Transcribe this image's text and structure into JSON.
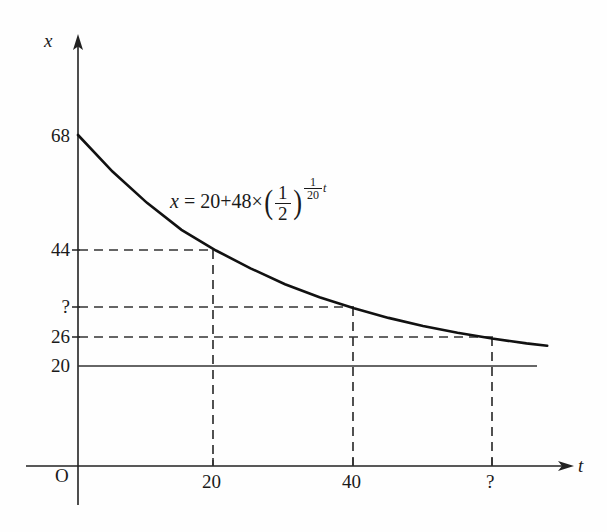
{
  "chart_data": {
    "type": "line",
    "title": "",
    "xlabel": "t",
    "ylabel": "x",
    "equation_text": "x = 20+48×(1/2)^((1/20)t)",
    "equation_parts": {
      "lhs": "x",
      "equals": "=",
      "constant": "20",
      "plus": "+",
      "coefficient": "48",
      "times": "×",
      "base_numerator": "1",
      "base_denominator": "2",
      "exponent_numerator": "1",
      "exponent_denominator": "20",
      "exponent_variable": "t"
    },
    "origin_label": "O",
    "x_ticks": [
      "20",
      "40",
      "?"
    ],
    "x_tick_values": [
      20,
      40,
      null
    ],
    "y_ticks": [
      "68",
      "44",
      "?",
      "26",
      "20"
    ],
    "y_tick_values": [
      68,
      44,
      null,
      26,
      20
    ],
    "asymptote_value": 20,
    "asymptote_label": "20",
    "xlim": [
      0,
      75
    ],
    "ylim": [
      0,
      75
    ],
    "grid": false,
    "legend": "none",
    "series": [
      {
        "name": "x = 20 + 48(1/2)^(t/20)",
        "x": [
          0,
          5,
          10,
          15,
          20,
          25,
          30,
          35,
          40,
          45,
          50,
          55,
          60,
          65,
          68
        ],
        "y": [
          68,
          60.4,
          53.9,
          48.3,
          44,
          40.3,
          37.0,
          34.3,
          32.0,
          30.0,
          28.3,
          26.9,
          25.7,
          24.7,
          24.2
        ]
      }
    ],
    "marked_points": [
      {
        "x": 20,
        "y": 44,
        "x_label": "20",
        "y_label": "44"
      },
      {
        "x": 40,
        "y": null,
        "x_label": "40",
        "y_label": "?"
      },
      {
        "x": null,
        "y": 26,
        "x_label": "?",
        "y_label": "26"
      }
    ],
    "annotations": [
      {
        "text": "x = 20+48×(1/2)^((1/20)t)",
        "kind": "equation"
      }
    ]
  }
}
